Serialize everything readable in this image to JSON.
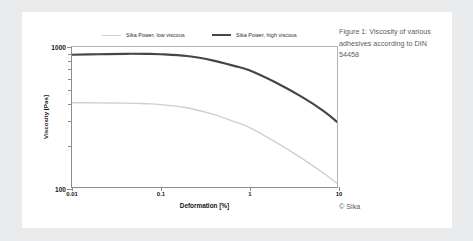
{
  "caption": {
    "text": "Figure 1: Viscosity of various adhesives according to DIN 54458",
    "copyright": "© Sika"
  },
  "chart_data": {
    "type": "line",
    "title": "",
    "xlabel": "Deformation [%]",
    "ylabel": "Viscosity [Pas]",
    "xscale": "log",
    "yscale": "log",
    "xlim": [
      0.01,
      10
    ],
    "ylim": [
      100,
      1000
    ],
    "xticks": [
      "0.01",
      "0.1",
      "1",
      "10"
    ],
    "xtick_values": [
      0.01,
      0.1,
      1,
      10
    ],
    "yticks": [
      "1000",
      "100"
    ],
    "ytick_values": [
      1000,
      100
    ],
    "grid": false,
    "legend_position": "top",
    "series": [
      {
        "name": "Sika Power, low viscous",
        "color": "#cfcfcf",
        "width": 1.4,
        "x": [
          0.01,
          0.02,
          0.04,
          0.07,
          0.1,
          0.2,
          0.4,
          0.7,
          1,
          2,
          4,
          7,
          10
        ],
        "y": [
          400,
          399,
          397,
          393,
          388,
          368,
          330,
          292,
          268,
          210,
          160,
          126,
          106
        ]
      },
      {
        "name": "Sika Power, high viscous",
        "color": "#464646",
        "width": 2.2,
        "x": [
          0.01,
          0.02,
          0.04,
          0.07,
          0.1,
          0.2,
          0.4,
          0.7,
          1,
          2,
          4,
          7,
          10
        ],
        "y": [
          880,
          888,
          894,
          893,
          888,
          862,
          800,
          730,
          685,
          560,
          440,
          350,
          292
        ]
      }
    ]
  }
}
